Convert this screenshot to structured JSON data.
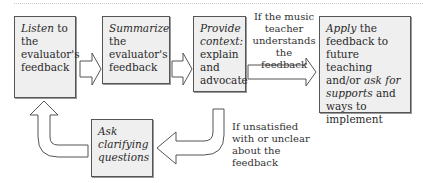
{
  "boxes": {
    "listen": {
      "em": "Listen",
      "rest": " to the evaluator's feedback"
    },
    "summarize": {
      "em": "Summarize",
      "rest": " the evaluator's feedback"
    },
    "context": {
      "em": "Provide context:",
      "rest": " explain and advocate"
    },
    "apply": {
      "em1": "Apply",
      "t1": " the feedback to future teaching and/or ",
      "em2": "ask for supports",
      "t2": " and ways to implement"
    },
    "ask": {
      "em": "Ask clarifying questions"
    }
  },
  "labels": {
    "understands": "If the music teacher understands the feedback",
    "unsatisfied": "If unsatisfied with or unclear about the feedback"
  }
}
